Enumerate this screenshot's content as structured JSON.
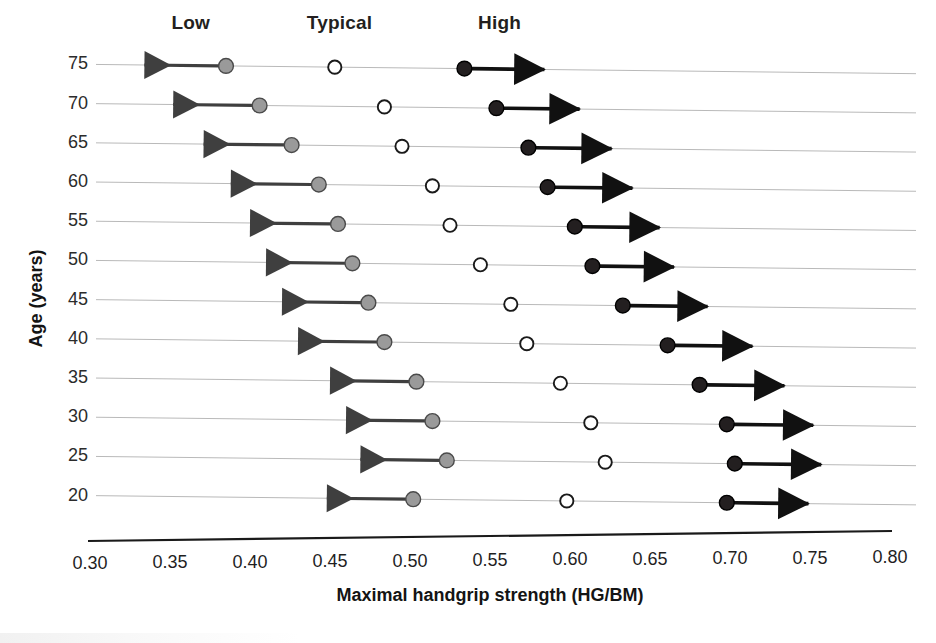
{
  "chart_data": {
    "type": "scatter",
    "title": "",
    "xlabel": "Maximal handgrip strength (HG/BM)",
    "ylabel": "Age (years)",
    "xlim": [
      0.3,
      0.8
    ],
    "xticks": [
      "0.30",
      "0.35",
      "0.40",
      "0.45",
      "0.50",
      "0.55",
      "0.60",
      "0.65",
      "0.70",
      "0.75",
      "0.80"
    ],
    "xtick_values": [
      0.3,
      0.35,
      0.4,
      0.45,
      0.5,
      0.55,
      0.6,
      0.65,
      0.7,
      0.75,
      0.8
    ],
    "ylim": [
      17.5,
      77.5
    ],
    "categories": [
      75,
      70,
      65,
      60,
      55,
      50,
      45,
      40,
      35,
      30,
      25,
      20
    ],
    "ytick_labels": [
      "75",
      "70",
      "65",
      "60",
      "55",
      "50",
      "45",
      "40",
      "35",
      "30",
      "25",
      "20"
    ],
    "grid": true,
    "legend": [
      "Low",
      "Typical",
      "High"
    ],
    "legend_position": "top",
    "band_labels": [
      {
        "text": "Low",
        "x": 0.363
      },
      {
        "text": "Typical",
        "x": 0.456
      },
      {
        "text": "High",
        "x": 0.556
      }
    ],
    "series": [
      {
        "name": "Low",
        "marker": "filled-circle",
        "color": "#9a9a9a",
        "edge_color": "#4a4a4a",
        "arrow_direction": "left",
        "values": [
          0.385,
          0.406,
          0.426,
          0.443,
          0.455,
          0.464,
          0.474,
          0.484,
          0.504,
          0.514,
          0.523,
          0.502
        ],
        "arrow_tips": [
          0.334,
          0.352,
          0.371,
          0.388,
          0.4,
          0.41,
          0.42,
          0.43,
          0.45,
          0.46,
          0.469,
          0.448
        ]
      },
      {
        "name": "Typical",
        "marker": "open-circle",
        "color": "#ffffff",
        "edge_color": "#1a1a1a",
        "arrow_direction": "none",
        "values": [
          0.453,
          0.484,
          0.495,
          0.514,
          0.525,
          0.544,
          0.563,
          0.573,
          0.594,
          0.613,
          0.622,
          0.598
        ],
        "arrow_tips": [
          null,
          null,
          null,
          null,
          null,
          null,
          null,
          null,
          null,
          null,
          null,
          null
        ]
      },
      {
        "name": "High",
        "marker": "filled-circle",
        "color": "#231f20",
        "edge_color": "#000000",
        "arrow_direction": "right",
        "values": [
          0.534,
          0.554,
          0.574,
          0.586,
          0.603,
          0.614,
          0.633,
          0.661,
          0.681,
          0.698,
          0.703,
          0.698
        ],
        "arrow_tips": [
          0.584,
          0.606,
          0.626,
          0.639,
          0.656,
          0.665,
          0.686,
          0.714,
          0.734,
          0.752,
          0.757,
          0.749
        ]
      }
    ]
  },
  "axes": {
    "x_axis_title": "Maximal handgrip strength (HG/BM)",
    "y_axis_title": "Age (years)"
  }
}
